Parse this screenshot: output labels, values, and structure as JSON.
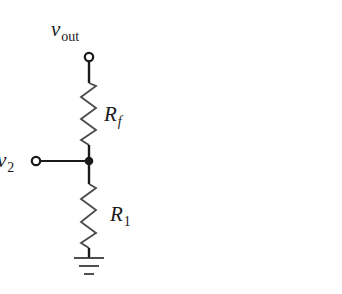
{
  "diagram": {
    "type": "circuit-schematic",
    "colors": {
      "wire": "#1a1a1a",
      "resistor": "#4a4a4a",
      "background": "#ffffff"
    },
    "labels": {
      "vout": {
        "main": "v",
        "sub": "out"
      },
      "rf": {
        "main": "R",
        "sub": "f"
      },
      "r1": {
        "main": "R",
        "sub": "1"
      },
      "v2": {
        "main": "v",
        "sub": "2"
      }
    },
    "components": [
      {
        "id": "vout-terminal",
        "kind": "terminal",
        "label": "vout"
      },
      {
        "id": "Rf",
        "kind": "resistor",
        "label": "Rf"
      },
      {
        "id": "node",
        "kind": "junction"
      },
      {
        "id": "v2-terminal",
        "kind": "terminal",
        "label": "v2"
      },
      {
        "id": "R1",
        "kind": "resistor",
        "label": "R1"
      },
      {
        "id": "ground",
        "kind": "ground"
      }
    ]
  }
}
